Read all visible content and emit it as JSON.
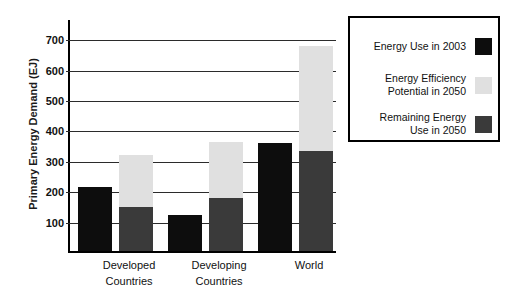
{
  "chart_data": {
    "type": "bar",
    "subtype": "grouped-stacked",
    "title": "",
    "xlabel": "",
    "ylabel": "Primary Energy Demand (EJ)",
    "ylim": [
      0,
      760
    ],
    "yticks": [
      100,
      200,
      300,
      400,
      500,
      600,
      700
    ],
    "ytick_labels": [
      "100",
      "200",
      "300",
      "400",
      "500",
      "600",
      "700"
    ],
    "grid": true,
    "legend_position": "right",
    "categories": [
      "Developed Countries",
      "Developing Countries",
      "World"
    ],
    "category_lines": [
      [
        "Developed",
        "Countries"
      ],
      [
        "Developing",
        "Countries"
      ],
      [
        "World",
        ""
      ]
    ],
    "series": [
      {
        "name": "Energy Use in 2003",
        "color": "#0d0d0d",
        "stack": "2003",
        "values": [
          210,
          120,
          355
        ]
      },
      {
        "name": "Remaining Energy Use in 2050",
        "color": "#3a3a3a",
        "stack": "2050",
        "values": [
          145,
          175,
          330
        ]
      },
      {
        "name": "Energy Efficiency Potential in 2050",
        "color": "#e0e0e0",
        "stack": "2050",
        "values": [
          170,
          185,
          345
        ]
      }
    ],
    "stack_2050_totals": [
      315,
      360,
      675
    ],
    "legend": [
      {
        "label": "Energy Use in 2003",
        "color": "#0d0d0d",
        "lines": [
          "Energy Use in 2003"
        ]
      },
      {
        "label": "Energy Efficiency Potential in 2050",
        "color": "#e0e0e0",
        "lines": [
          "Energy Efficiency",
          "Potential in 2050"
        ]
      },
      {
        "label": "Remaining Energy Use in 2050",
        "color": "#3a3a3a",
        "lines": [
          "Remaining Energy",
          "Use in 2050"
        ]
      }
    ]
  }
}
